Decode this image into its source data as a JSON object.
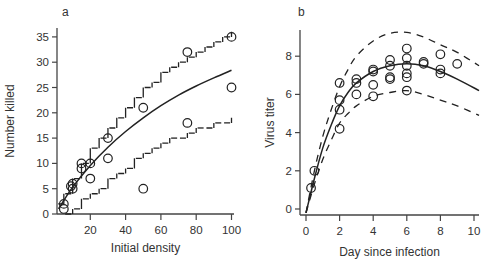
{
  "chart_data": [
    {
      "panel_label": "a",
      "type": "scatter",
      "title": "",
      "xlabel": "Initial density",
      "ylabel": "Number killed",
      "xlim": [
        0,
        102
      ],
      "ylim": [
        0,
        36
      ],
      "xticks": [
        20,
        40,
        60,
        80,
        100
      ],
      "yticks": [
        0,
        5,
        10,
        15,
        20,
        25,
        30,
        35
      ],
      "grid": false,
      "series": [
        {
          "name": "observed",
          "style": "open-circle",
          "x": [
            5,
            5,
            10,
            10,
            9,
            15,
            15,
            20,
            20,
            30,
            30,
            50,
            50,
            75,
            75,
            100,
            100
          ],
          "y": [
            1,
            2,
            5,
            6,
            5.5,
            9,
            10,
            7,
            10,
            11,
            15,
            5,
            21,
            18,
            32,
            25,
            35
          ]
        },
        {
          "name": "fitted",
          "style": "solid-line",
          "x": [
            2,
            10,
            20,
            30,
            40,
            50,
            60,
            70,
            80,
            90,
            100
          ],
          "y": [
            1,
            5.3,
            9.6,
            13.2,
            16.3,
            19.0,
            21.4,
            23.5,
            25.3,
            26.9,
            28.4
          ]
        },
        {
          "name": "upper bound",
          "style": "dashed-step",
          "x": [
            2,
            5,
            10,
            15,
            20,
            25,
            30,
            35,
            40,
            45,
            50,
            55,
            60,
            65,
            70,
            75,
            80,
            85,
            90,
            95,
            100
          ],
          "y": [
            2,
            4,
            7,
            10,
            13,
            15,
            17,
            19,
            21,
            23,
            25,
            26,
            28,
            29,
            30,
            31,
            32,
            33,
            34,
            35,
            36
          ]
        },
        {
          "name": "lower bound",
          "style": "dashed-step",
          "x": [
            5,
            10,
            15,
            20,
            25,
            30,
            35,
            40,
            45,
            50,
            55,
            60,
            65,
            70,
            75,
            80,
            85,
            90,
            95,
            100
          ],
          "y": [
            0,
            1,
            3,
            4,
            5,
            7,
            8,
            9,
            11,
            12,
            13,
            14,
            15,
            15,
            16,
            17,
            17,
            18,
            18,
            19
          ]
        }
      ]
    },
    {
      "panel_label": "b",
      "type": "scatter",
      "title": "",
      "xlabel": "Day since infection",
      "ylabel": "Virus titer",
      "xlim": [
        -0.3,
        10.3
      ],
      "ylim": [
        -0.3,
        9.4
      ],
      "xticks": [
        0,
        2,
        4,
        6,
        8,
        10
      ],
      "yticks": [
        0,
        2,
        4,
        6,
        8
      ],
      "grid": false,
      "series": [
        {
          "name": "observed",
          "style": "open-circle",
          "x": [
            0.3,
            0.5,
            2,
            2,
            2,
            2,
            3,
            3,
            3,
            4,
            4,
            4,
            4,
            5,
            5,
            5,
            5,
            6,
            6,
            6,
            6,
            6,
            6,
            7,
            7,
            8,
            8,
            8,
            9
          ],
          "y": [
            1.1,
            2.0,
            6.6,
            5.7,
            5.2,
            4.2,
            6.8,
            6.6,
            6.0,
            7.3,
            7.2,
            6.5,
            5.9,
            7.8,
            7.5,
            6.9,
            6.8,
            8.4,
            7.9,
            7.5,
            7.1,
            6.9,
            6.2,
            7.7,
            7.6,
            8.1,
            7.3,
            7.1,
            7.6
          ]
        },
        {
          "name": "fitted",
          "style": "solid-line",
          "x": [
            0,
            0.5,
            1,
            1.5,
            2,
            2.5,
            3,
            4,
            5,
            6,
            7,
            8,
            9,
            10.3
          ],
          "y": [
            -0.2,
            1.6,
            3.2,
            4.4,
            5.4,
            6.1,
            6.6,
            7.2,
            7.5,
            7.6,
            7.5,
            7.2,
            6.8,
            6.2
          ]
        },
        {
          "name": "upper bound",
          "style": "dashed-line",
          "x": [
            0,
            0.5,
            1,
            1.5,
            2,
            2.5,
            3,
            4,
            5,
            6,
            7,
            8,
            9,
            10.3
          ],
          "y": [
            -0.2,
            2.0,
            3.8,
            5.2,
            6.4,
            7.3,
            8.0,
            8.8,
            9.2,
            9.25,
            9.0,
            8.6,
            8.2,
            7.5
          ]
        },
        {
          "name": "lower bound",
          "style": "dashed-line",
          "x": [
            0,
            0.5,
            1,
            1.5,
            2,
            2.5,
            3,
            4,
            5,
            6,
            7,
            8,
            9,
            10.3
          ],
          "y": [
            -0.2,
            1.3,
            2.6,
            3.6,
            4.5,
            5.0,
            5.4,
            5.9,
            6.1,
            6.2,
            6.0,
            5.7,
            5.4,
            4.9
          ]
        }
      ]
    }
  ]
}
